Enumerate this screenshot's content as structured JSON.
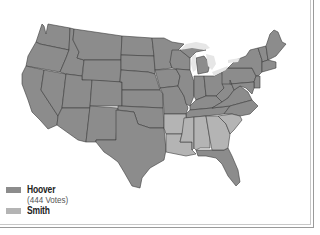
{
  "map": {
    "title": "",
    "colors": {
      "hoover": "#8c8c8c",
      "smith": "#b4b4b4",
      "border": "#3c3c3c",
      "lakes": "#e6e6e6"
    },
    "candidates": [
      {
        "name": "Hoover",
        "votes_label": "(444 Votes)",
        "color": "#8c8c8c",
        "states": [
          "WA",
          "OR",
          "CA",
          "NV",
          "ID",
          "MT",
          "WY",
          "UT",
          "AZ",
          "CO",
          "NM",
          "ND",
          "SD",
          "NE",
          "KS",
          "OK",
          "TX",
          "MN",
          "IA",
          "MO",
          "WI",
          "IL",
          "MI",
          "IN",
          "OH",
          "KY",
          "TN",
          "WV",
          "VA",
          "NC",
          "FL",
          "PA",
          "NY",
          "NJ",
          "DE",
          "MD",
          "CT",
          "VT",
          "NH",
          "ME"
        ]
      },
      {
        "name": "Smith",
        "votes_label": "",
        "color": "#b4b4b4",
        "states": [
          "AR",
          "LA",
          "MS",
          "AL",
          "GA",
          "SC"
        ]
      }
    ]
  },
  "legend": {
    "items": [
      {
        "label": "Hoover",
        "sub": "(444 Votes)",
        "color": "#8c8c8c"
      },
      {
        "label": "Smith",
        "sub": "",
        "color": "#b4b4b4"
      }
    ]
  }
}
